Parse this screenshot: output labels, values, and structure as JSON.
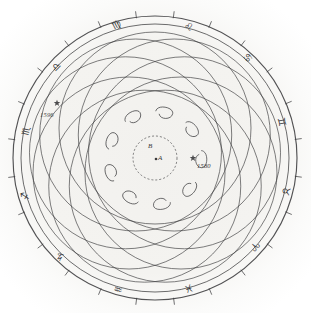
{
  "figure": {
    "background_color": "#f4f3f0",
    "ink_color": "#3a3a3c",
    "center_point_label": "A",
    "center_circle_label": "B",
    "width": 311,
    "height": 313
  },
  "annotations": [
    {
      "name": "epoch-start",
      "text": "1596",
      "x": 40,
      "y": 112,
      "marker_x": 57,
      "marker_y": 103
    },
    {
      "name": "epoch-end",
      "text": "1580",
      "x": 197,
      "y": 163,
      "marker_x": 193,
      "marker_y": 158
    }
  ],
  "zodiac": {
    "ring_label": "zodiac band",
    "signs": [
      {
        "name": "virgo",
        "glyph": "♍",
        "x": 112,
        "y": 20,
        "rotate": -28
      },
      {
        "name": "leo",
        "glyph": "♌",
        "x": 184,
        "y": 22,
        "rotate": 22
      },
      {
        "name": "cancer",
        "glyph": "♋",
        "x": 243,
        "y": 53,
        "rotate": 50
      },
      {
        "name": "gemini",
        "glyph": "♊",
        "x": 277,
        "y": 117,
        "rotate": 78
      },
      {
        "name": "taurus",
        "glyph": "♉",
        "x": 281,
        "y": 186,
        "rotate": 104
      },
      {
        "name": "aries",
        "glyph": "♈",
        "x": 250,
        "y": 241,
        "rotate": 132
      },
      {
        "name": "pisces",
        "glyph": "♓",
        "x": 184,
        "y": 283,
        "rotate": 160
      },
      {
        "name": "aquarius",
        "glyph": "♒",
        "x": 114,
        "y": 284,
        "rotate": 196
      },
      {
        "name": "capricorn",
        "glyph": "♑",
        "x": 56,
        "y": 251,
        "rotate": 228
      },
      {
        "name": "sagittarius",
        "glyph": "♐",
        "x": 21,
        "y": 191,
        "rotate": 258
      },
      {
        "name": "scorpio",
        "glyph": "♏",
        "x": 22,
        "y": 126,
        "rotate": 284
      },
      {
        "name": "libra",
        "glyph": "♎",
        "x": 52,
        "y": 62,
        "rotate": 314
      }
    ]
  },
  "chart_data": {
    "type": "scatter",
    "center": {
      "x": 155,
      "y": 158
    },
    "outer_radius_outer": 142,
    "outer_radius_inner": 134,
    "inner_circle_radius": 22,
    "epicycle_count": 9,
    "epicycle_path_radius": 96,
    "loop_count": 9,
    "loop_ring_radius": 46,
    "tick_count": 24,
    "xlabel": "",
    "ylabel": "",
    "grid": false,
    "legend": "none"
  }
}
